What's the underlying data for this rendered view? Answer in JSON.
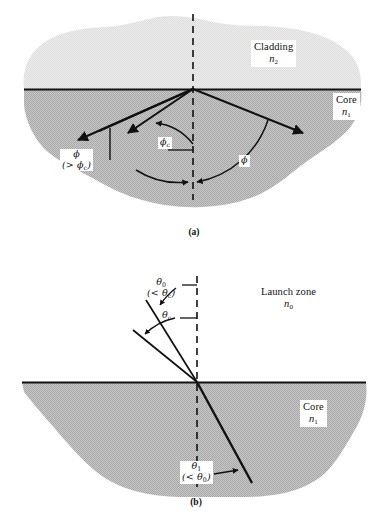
{
  "figure": {
    "title_hidden": "Optical fiber ray propagation: total internal reflection and launch acceptance",
    "background_color": "#ffffff",
    "cladding_fill": "#e8e8e8",
    "core_fill": "#bdbdbd",
    "line_color": "#111111"
  },
  "panel_a": {
    "caption": "(a)",
    "cladding": {
      "name_line": "Cladding",
      "index_line": "n2"
    },
    "core": {
      "name_line": "Core",
      "index_line": "n1"
    },
    "angles": [
      {
        "id": "phi-critical",
        "line1": "ϕc",
        "line2": ""
      },
      {
        "id": "phi-greater",
        "line1": "ϕ",
        "line2": "(> ϕc)"
      },
      {
        "id": "phi-plain",
        "line1": "ϕ",
        "line2": ""
      }
    ]
  },
  "panel_b": {
    "caption": "(b)",
    "launch_zone": {
      "name_line": "Launch zone",
      "index_line": "n0"
    },
    "core": {
      "name_line": "Core",
      "index_line": "n1"
    },
    "angles": [
      {
        "id": "theta-zero",
        "line1": "θ0",
        "line2": "(< θc)"
      },
      {
        "id": "theta-critical",
        "line1": "θc",
        "line2": ""
      },
      {
        "id": "theta-one",
        "line1": "θ1",
        "line2": "(< θ0)"
      }
    ]
  }
}
